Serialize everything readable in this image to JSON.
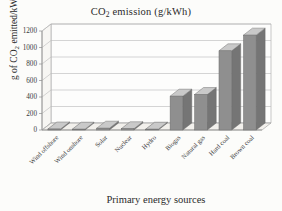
{
  "chart_data": {
    "type": "bar",
    "title": "CO2 emission (g/kWh)",
    "title_main": "CO",
    "title_sub": "2",
    "title_rest": " emission (g/kWh)",
    "xlabel": "Primary energy sources",
    "ylabel": "g of CO2 emitted/kWh",
    "ylabel_main": "g of CO",
    "ylabel_sub": "2",
    "ylabel_rest": " emitted/kWh",
    "categories": [
      "Wind offshore",
      "Wind onshore",
      "Solar",
      "Nuclear",
      "Hydro",
      "Biogas",
      "Natural gas",
      "Hard coal",
      "Brown coal"
    ],
    "values": [
      12,
      10,
      22,
      15,
      10,
      410,
      430,
      960,
      1150
    ],
    "ylim": [
      0,
      1200
    ],
    "yticks": [
      0,
      200,
      400,
      600,
      800,
      1000,
      1200
    ],
    "ytick_labels": [
      "0",
      "200",
      "400",
      "600",
      "800",
      "1000",
      "1200"
    ],
    "grid": true,
    "legend": "none",
    "style": "3d-column",
    "colors": {
      "bar_front": "#8f8f8f",
      "bar_top": "#c9c9c9",
      "bar_side": "#757575",
      "gridline": "#b9b9b9",
      "axis": "#8e8e8e",
      "text": "#2b2b2b",
      "background": "#fcfcfa"
    }
  }
}
